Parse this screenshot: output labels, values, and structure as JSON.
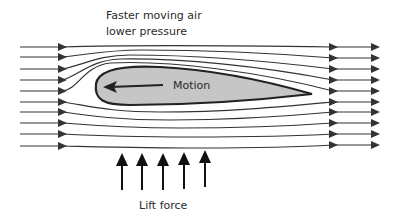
{
  "diagram": {
    "title_lines": [
      "Faster moving air",
      "lower pressure"
    ],
    "airfoil_label": "Motion",
    "lift_label": "Lift force",
    "colors": {
      "line": "#333333",
      "airfoil_fill": "#c6c6c6",
      "airfoil_stroke": "#222222",
      "text": "#2a2a2a"
    },
    "streamline_count": 10,
    "lift_arrow_count": 5
  }
}
